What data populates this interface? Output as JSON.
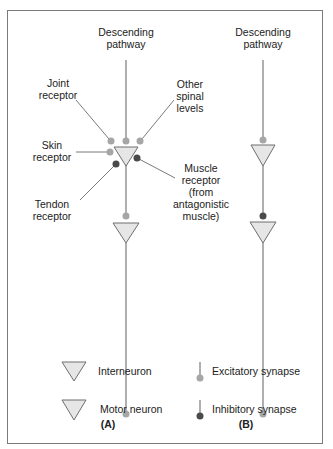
{
  "colors": {
    "excitatory": "#a6a6a6",
    "inhibitory": "#4a4a4a",
    "line": "#7a7a7a",
    "neuron_fill": "#e6e6e6",
    "neuron_stroke": "#6e6e6e"
  },
  "panel_a": {
    "label": "(A)",
    "descending_pathway": [
      "Descending",
      "pathway"
    ],
    "joint_receptor": [
      "Joint",
      "receptor"
    ],
    "other_spinal_levels": [
      "Other",
      "spinal",
      "levels"
    ],
    "skin_receptor": [
      "Skin",
      "receptor"
    ],
    "muscle_receptor": [
      "Muscle",
      "receptor",
      "(from",
      "antagonistic",
      "muscle)"
    ],
    "tendon_receptor": [
      "Tendon",
      "receptor"
    ]
  },
  "panel_b": {
    "label": "(B)",
    "descending_pathway": [
      "Descending",
      "pathway"
    ]
  },
  "legend": {
    "interneuron": "Interneuron",
    "motor_neuron": "Motor neuron",
    "excitatory_synapse": "Excitatory synapse",
    "inhibitory_synapse": "Inhibitory synapse"
  }
}
